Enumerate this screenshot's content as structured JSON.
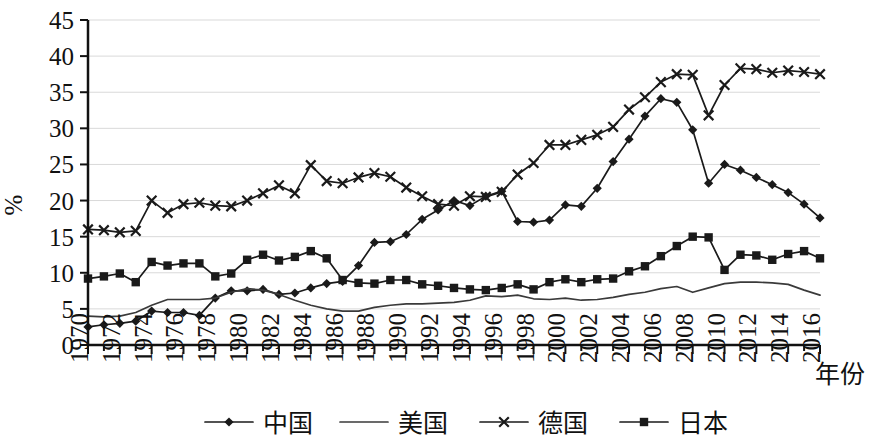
{
  "chart_data": {
    "type": "line",
    "title": "",
    "xlabel": "年份",
    "ylabel": "%",
    "xlim": [
      1970,
      2016
    ],
    "ylim": [
      0,
      45
    ],
    "ytick_step": 5,
    "xtick_step": 2,
    "grid": true,
    "legend_position": "bottom",
    "yticks": [
      0,
      5,
      10,
      15,
      20,
      25,
      30,
      35,
      40,
      45
    ],
    "xticks": [
      1970,
      1972,
      1974,
      1976,
      1978,
      1980,
      1982,
      1984,
      1986,
      1988,
      1990,
      1992,
      1994,
      1996,
      1998,
      2000,
      2002,
      2004,
      2006,
      2008,
      2010,
      2012,
      2014,
      2016
    ],
    "x": [
      1970,
      1971,
      1972,
      1973,
      1974,
      1975,
      1976,
      1977,
      1978,
      1979,
      1980,
      1981,
      1982,
      1983,
      1984,
      1985,
      1986,
      1987,
      1988,
      1989,
      1990,
      1991,
      1992,
      1993,
      1994,
      1995,
      1996,
      1997,
      1998,
      1999,
      2000,
      2001,
      2002,
      2003,
      2004,
      2005,
      2006,
      2007,
      2008,
      2009,
      2010,
      2011,
      2012,
      2013,
      2014,
      2015,
      2016
    ],
    "series": [
      {
        "name": "中国",
        "marker": "diamond",
        "values": [
          2.5,
          2.8,
          3.0,
          3.3,
          4.7,
          4.5,
          4.5,
          4.1,
          6.5,
          7.5,
          7.5,
          7.7,
          7.0,
          7.2,
          7.9,
          8.5,
          8.8,
          11.0,
          14.2,
          14.3,
          15.3,
          17.4,
          18.7,
          20.0,
          19.3,
          20.6,
          21.3,
          17.1,
          17.0,
          17.3,
          19.4,
          19.2,
          21.7,
          25.4,
          28.5,
          31.7,
          34.1,
          33.6,
          29.8,
          22.4,
          25.0,
          24.2,
          23.2,
          22.2,
          21.1,
          19.5,
          17.6
        ]
      },
      {
        "name": "美国",
        "marker": "none",
        "values": [
          4.0,
          3.9,
          4.0,
          4.5,
          5.5,
          6.3,
          6.3,
          6.3,
          6.5,
          7.3,
          7.8,
          7.6,
          7.0,
          6.2,
          5.5,
          5.0,
          4.7,
          4.7,
          5.2,
          5.5,
          5.7,
          5.7,
          5.8,
          5.9,
          6.2,
          6.8,
          6.7,
          6.9,
          6.4,
          6.3,
          6.5,
          6.2,
          6.3,
          6.6,
          7.0,
          7.3,
          7.8,
          8.1,
          7.3,
          7.9,
          8.5,
          8.7,
          8.7,
          8.6,
          8.4,
          7.6,
          6.9
        ]
      },
      {
        "name": "德国",
        "marker": "x",
        "values": [
          16.0,
          15.9,
          15.6,
          15.8,
          20.0,
          18.3,
          19.5,
          19.7,
          19.3,
          19.2,
          20.0,
          21.0,
          22.1,
          21.0,
          24.9,
          22.7,
          22.4,
          23.2,
          23.8,
          23.3,
          21.8,
          20.6,
          19.5,
          19.3,
          20.6,
          20.5,
          21.2,
          23.6,
          25.2,
          27.7,
          27.7,
          28.4,
          29.1,
          30.2,
          32.6,
          34.3,
          36.4,
          37.5,
          37.4,
          31.8,
          36.0,
          38.3,
          38.2,
          37.7,
          38.0,
          37.8,
          37.5
        ]
      },
      {
        "name": "日本",
        "marker": "square",
        "values": [
          9.2,
          9.5,
          9.9,
          8.7,
          11.5,
          11.0,
          11.3,
          11.3,
          9.5,
          9.9,
          11.8,
          12.5,
          11.7,
          12.2,
          13.0,
          12.0,
          9.0,
          8.6,
          8.5,
          9.0,
          9.0,
          8.4,
          8.2,
          7.9,
          7.7,
          7.6,
          7.9,
          8.4,
          7.7,
          8.7,
          9.1,
          8.7,
          9.1,
          9.2,
          10.2,
          10.9,
          12.3,
          13.7,
          15.0,
          14.9,
          10.4,
          12.5,
          12.4,
          11.8,
          12.6,
          13.0,
          12.0
        ]
      }
    ]
  },
  "legend": {
    "items": [
      {
        "label": "中国",
        "marker": "diamond"
      },
      {
        "label": "美国",
        "marker": "none"
      },
      {
        "label": "德国",
        "marker": "x"
      },
      {
        "label": "日本",
        "marker": "square"
      }
    ]
  },
  "colors": {
    "line": "#1a1a1a",
    "grid": "#d9d9d9",
    "axis": "#111111",
    "background": "#ffffff"
  }
}
